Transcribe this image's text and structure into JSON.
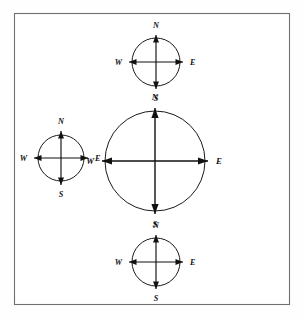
{
  "figure": {
    "background_color": "#fefefe",
    "frame": {
      "name": "outer-frame",
      "stroke_color": "#6e6e74",
      "fill_color": "#ffffff",
      "x": 14,
      "y": 13,
      "width": 276,
      "height": 292
    },
    "label_color": "#111111",
    "line_color": "#111111",
    "circle_color": "#1a1a1a"
  },
  "compass_roses": [
    {
      "id": "top",
      "name": "compass-rose-top",
      "position": "top-center",
      "center_x": 156,
      "center_y": 62,
      "radius": 24,
      "arrow_reach": 27,
      "label_offset": 9,
      "size_class": "small",
      "labels": {
        "north": "N",
        "south": "S",
        "east": "E",
        "west": "W"
      }
    },
    {
      "id": "left",
      "name": "compass-rose-left",
      "position": "middle-left",
      "center_x": 61,
      "center_y": 158,
      "radius": 23,
      "arrow_reach": 27,
      "label_offset": 9,
      "size_class": "small",
      "labels": {
        "north": "N",
        "south": "S",
        "east": "E",
        "west": "W"
      }
    },
    {
      "id": "center",
      "name": "compass-rose-center",
      "position": "middle-center",
      "center_x": 155,
      "center_y": 161,
      "radius": 50,
      "arrow_reach": 53,
      "label_offset": 10,
      "size_class": "large",
      "labels": {
        "north": "N",
        "south": "S",
        "east": "E",
        "west": "W"
      }
    },
    {
      "id": "bottom",
      "name": "compass-rose-bottom",
      "position": "bottom-center",
      "center_x": 156,
      "center_y": 262,
      "radius": 24,
      "arrow_reach": 27,
      "label_offset": 9,
      "size_class": "small",
      "labels": {
        "north": "N",
        "south": "S",
        "east": "E",
        "west": "W"
      }
    }
  ]
}
